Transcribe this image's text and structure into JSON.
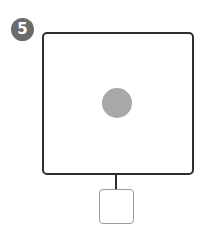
{
  "step_badge": {
    "number": "5",
    "color": "#6b6b6b"
  },
  "diagram": {
    "main_frame": {
      "border_color": "#2e2e2e"
    },
    "center_dot": {
      "color": "#a8a8a8"
    },
    "connector": {
      "color": "#2e2e2e"
    },
    "attached_box": {
      "border_color": "#9a9a9a"
    }
  }
}
